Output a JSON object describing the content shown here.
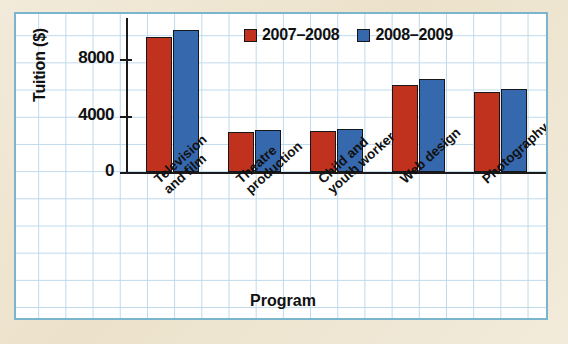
{
  "chart_data": {
    "type": "bar",
    "title": "",
    "xlabel": "Program",
    "ylabel": "Tuition ($)",
    "categories": [
      "Television\nand film",
      "Theatre\nproduction",
      "Child and\nyouth worker",
      "Web design",
      "Photography"
    ],
    "series": [
      {
        "name": "2007–2008",
        "color": "#c0321e",
        "values": [
          9600,
          2850,
          2900,
          6200,
          5700
        ]
      },
      {
        "name": "2008–2009",
        "color": "#3668ad",
        "values": [
          10100,
          3000,
          3050,
          6600,
          5850
        ]
      }
    ],
    "ylim": [
      0,
      11200
    ],
    "yticks": [
      0,
      4000,
      8000
    ],
    "ytick_labels": [
      "0",
      "4000",
      "8000"
    ],
    "grid": true,
    "legend_position": "top-right"
  },
  "legend": {
    "items": [
      {
        "label": "2007–2008",
        "color": "#c0321e"
      },
      {
        "label": "2008–2009",
        "color": "#3668ad"
      }
    ]
  },
  "axes": {
    "y_title": "Tuition ($)",
    "x_title": "Program",
    "y_ticks": [
      "8000",
      "4000",
      "0"
    ]
  },
  "colors": {
    "series_1": "#c0321e",
    "series_2": "#3668ad",
    "grid_line": "#bdd9ea",
    "panel_border": "#7bb4cf",
    "page_background": "#efe6d0"
  }
}
